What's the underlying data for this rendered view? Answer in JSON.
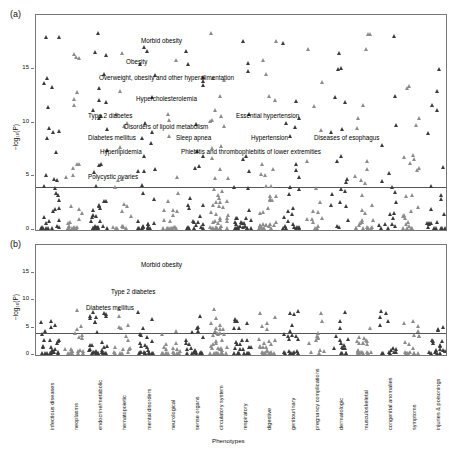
{
  "figure": {
    "panel_a_label": "(a)",
    "panel_b_label": "(b)",
    "xlabel": "Phenotypes",
    "ylabel": "−log₁₀(P)"
  },
  "chart_data": {
    "type": "scatter",
    "title": "",
    "xlabel": "Phenotypes",
    "ylabel": "-log10(P)",
    "grid": false,
    "legend": "none",
    "panels": [
      {
        "name": "a",
        "ylim": [
          0,
          20
        ],
        "yticks": [
          0,
          5,
          10,
          15
        ],
        "significance_line": 4.0,
        "annotations": [
          {
            "text": "Morbid obesity",
            "x": 105,
            "y": 17.6
          },
          {
            "text": "Obesity",
            "x": 90,
            "y": 15.6
          },
          {
            "text": "Overweight, obesity and other hyperalimentation",
            "x": 63,
            "y": 14.1
          },
          {
            "text": "Hypercholesterolemia",
            "x": 100,
            "y": 12.2
          },
          {
            "text": "Type 2 diabetes",
            "x": 52,
            "y": 10.6
          },
          {
            "text": "Essential hypertension",
            "x": 200,
            "y": 10.6
          },
          {
            "text": "Disorders of lipoid metabolism",
            "x": 88,
            "y": 9.6
          },
          {
            "text": "Diabetes mellitus",
            "x": 52,
            "y": 8.6
          },
          {
            "text": "Sleep apnea",
            "x": 140,
            "y": 8.6
          },
          {
            "text": "Hypertension",
            "x": 215,
            "y": 8.6
          },
          {
            "text": "Diseases of esophagus",
            "x": 278,
            "y": 8.6
          },
          {
            "text": "Hyperlipidemia",
            "x": 64,
            "y": 7.3
          },
          {
            "text": "Phlebitis and thrombophlebitis of lower extremities",
            "x": 145,
            "y": 7.3
          },
          {
            "text": "Polycystic ovaries",
            "x": 52,
            "y": 4.9
          }
        ]
      },
      {
        "name": "b",
        "ylim": [
          0,
          20
        ],
        "yticks": [
          0,
          5,
          10,
          15
        ],
        "significance_line": 4.0,
        "annotations": [
          {
            "text": "Morbid obesity",
            "x": 105,
            "y": 16.4
          },
          {
            "text": "Type 2 diabetes",
            "x": 75,
            "y": 11.4
          },
          {
            "text": "Diabetes mellitus",
            "x": 50,
            "y": 8.6
          }
        ]
      }
    ],
    "categories": [
      "infectious diseases",
      "neoplasms",
      "endocrine/metabolic",
      "hematopoietic",
      "mental disorders",
      "neurological",
      "sense organs",
      "circulatory system",
      "respiratory",
      "digestive",
      "genitourinary",
      "pregnancy complications",
      "dermatologic",
      "musculoskeletal",
      "congenital anomalies",
      "symptoms",
      "injuries & poisonings"
    ]
  }
}
